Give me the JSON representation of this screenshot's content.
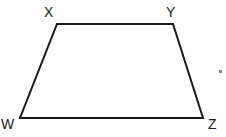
{
  "figure": {
    "name": "trapezoid-wxyz",
    "shape_type": "trapezoid",
    "canvas": {
      "width": 226,
      "height": 137,
      "background": "#ffffff"
    },
    "stroke": {
      "color": "#1a1a1a",
      "width": 2
    },
    "label_color": "#1a1a1a",
    "vertices": [
      {
        "id": "X",
        "label": "X",
        "x": 57,
        "y": 24,
        "label_x": 44,
        "label_y": 5
      },
      {
        "id": "Y",
        "label": "Y",
        "x": 173,
        "y": 24,
        "label_x": 166,
        "label_y": 5
      },
      {
        "id": "Z",
        "label": "Z",
        "x": 203,
        "y": 118,
        "label_x": 208,
        "label_y": 117
      },
      {
        "id": "W",
        "label": "W",
        "x": 20,
        "y": 118,
        "label_x": 1,
        "label_y": 117
      }
    ],
    "edges": [
      {
        "id": "XY",
        "from": "X",
        "to": "Y",
        "role": "top-base"
      },
      {
        "id": "YZ",
        "from": "Y",
        "to": "Z",
        "role": "right-leg"
      },
      {
        "id": "ZW",
        "from": "Z",
        "to": "W",
        "role": "bottom-base"
      },
      {
        "id": "WX",
        "from": "W",
        "to": "X",
        "role": "left-leg"
      }
    ],
    "path": "M 57 24 L 173 24 L 203 118 L 20 118 Z",
    "marks": [
      {
        "id": "stray-dot-right",
        "x": 219,
        "y": 70,
        "width": 3,
        "height": 3,
        "color": "#8a8a8a"
      }
    ]
  }
}
